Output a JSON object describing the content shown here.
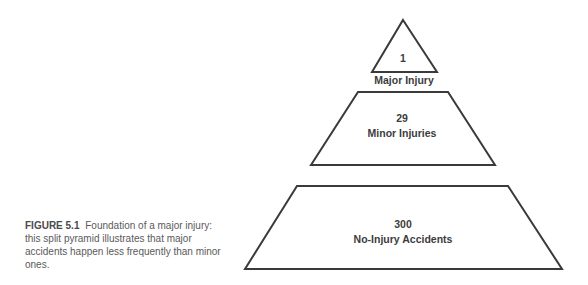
{
  "pyramid": {
    "levels": [
      {
        "value": "1",
        "label": "Major Injury"
      },
      {
        "value": "29",
        "label": "Minor Injuries"
      },
      {
        "value": "300",
        "label": "No-Injury Accidents"
      }
    ],
    "colors": {
      "stroke": "#3a3a3a",
      "fill": "#ffffff",
      "text": "#3c3c3c"
    }
  },
  "caption": {
    "figure_number": "FIGURE 5.1",
    "text": "Foundation of a major injury: this split pyramid illustrates that major accidents happen less frequently than minor ones."
  }
}
